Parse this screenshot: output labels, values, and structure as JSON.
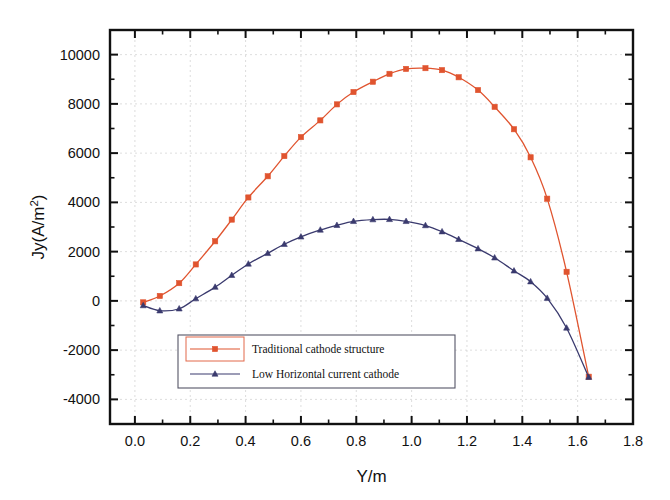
{
  "chart_data": {
    "type": "line",
    "title": "",
    "xlabel": "Y/m",
    "ylabel": "Jy(A/m2)",
    "ylabel_display": "Jy(A/m²)",
    "xlim": [
      -0.09,
      1.8
    ],
    "ylim": [
      -5000,
      11000
    ],
    "xticks": [
      0.0,
      0.2,
      0.4,
      0.6,
      0.8,
      1.0,
      1.2,
      1.4,
      1.6,
      1.8
    ],
    "xtick_labels": [
      "0.0",
      "0.2",
      "0.4",
      "0.6",
      "0.8",
      "1.0",
      "1.2",
      "1.4",
      "1.6",
      "1.8"
    ],
    "yticks": [
      -4000,
      -2000,
      0,
      2000,
      4000,
      6000,
      8000,
      10000
    ],
    "ytick_labels": [
      "-4000",
      "-2000",
      "0",
      "2000",
      "4000",
      "6000",
      "8000",
      "10000"
    ],
    "x_minor_step": 0.1,
    "y_minor_step": 1000,
    "grid": true,
    "grid_style": "dotted",
    "legend_position": "lower-left-inside",
    "series": [
      {
        "name": "Traditional cathode structure",
        "color": "#e0542f",
        "marker": "square",
        "points": [
          [
            0.03,
            -60
          ],
          [
            0.09,
            200
          ],
          [
            0.16,
            720
          ],
          [
            0.22,
            1480
          ],
          [
            0.29,
            2420
          ],
          [
            0.35,
            3300
          ],
          [
            0.41,
            4200
          ],
          [
            0.48,
            5060
          ],
          [
            0.54,
            5880
          ],
          [
            0.6,
            6650
          ],
          [
            0.67,
            7330
          ],
          [
            0.73,
            7980
          ],
          [
            0.79,
            8480
          ],
          [
            0.86,
            8900
          ],
          [
            0.92,
            9220
          ],
          [
            0.98,
            9420
          ],
          [
            1.05,
            9450
          ],
          [
            1.11,
            9370
          ],
          [
            1.17,
            9080
          ],
          [
            1.24,
            8560
          ],
          [
            1.3,
            7880
          ],
          [
            1.37,
            6970
          ],
          [
            1.43,
            5830
          ],
          [
            1.49,
            4150
          ],
          [
            1.56,
            1180
          ],
          [
            1.64,
            -3080
          ]
        ]
      },
      {
        "name": "Low Horizontal current cathode",
        "color": "#3a3a6e",
        "marker": "triangle",
        "points": [
          [
            0.03,
            -190
          ],
          [
            0.09,
            -400
          ],
          [
            0.16,
            -320
          ],
          [
            0.22,
            90
          ],
          [
            0.29,
            560
          ],
          [
            0.35,
            1040
          ],
          [
            0.41,
            1500
          ],
          [
            0.48,
            1930
          ],
          [
            0.54,
            2300
          ],
          [
            0.6,
            2600
          ],
          [
            0.67,
            2880
          ],
          [
            0.73,
            3070
          ],
          [
            0.79,
            3230
          ],
          [
            0.86,
            3300
          ],
          [
            0.92,
            3310
          ],
          [
            0.98,
            3230
          ],
          [
            1.05,
            3060
          ],
          [
            1.11,
            2810
          ],
          [
            1.17,
            2500
          ],
          [
            1.24,
            2120
          ],
          [
            1.3,
            1750
          ],
          [
            1.37,
            1220
          ],
          [
            1.43,
            780
          ],
          [
            1.49,
            110
          ],
          [
            1.56,
            -1100
          ],
          [
            1.64,
            -3100
          ]
        ]
      }
    ]
  },
  "legend": {
    "items": [
      {
        "label": "Traditional cathode structure",
        "color": "#e0542f",
        "marker": "square"
      },
      {
        "label": "Low Horizontal current cathode",
        "color": "#3a3a6e",
        "marker": "triangle"
      }
    ]
  },
  "colors": {
    "series_red": "#e0542f",
    "series_blue": "#3a3a6e",
    "axis": "#111111",
    "grid": "#cfcfcf",
    "background": "#ffffff"
  }
}
